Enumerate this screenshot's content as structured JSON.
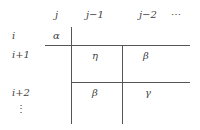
{
  "diagram": {
    "column_headers": [
      "j",
      "j−1",
      "j−2",
      "⋯"
    ],
    "row_headers": [
      "i",
      "i+1",
      "i+2",
      "⋮"
    ],
    "cells": {
      "alpha": "α",
      "eta": "η",
      "beta_top": "β",
      "beta_bottom": "β",
      "gamma": "γ"
    },
    "line_color": "#555555"
  }
}
